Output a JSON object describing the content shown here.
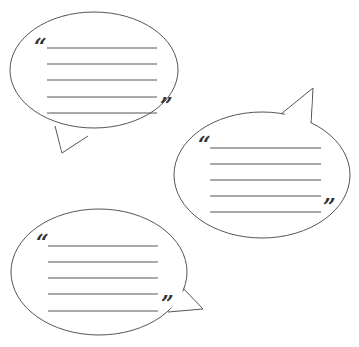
{
  "illustration": {
    "description": "Three blank speech bubbles with writing lines",
    "stroke_color": "#555555",
    "line_color": "#555555",
    "bubbles": [
      {
        "id": "bubble-1",
        "open_quote": "“",
        "close_quote": "”",
        "line_count": 5
      },
      {
        "id": "bubble-2",
        "open_quote": "“",
        "close_quote": "”",
        "line_count": 5
      },
      {
        "id": "bubble-3",
        "open_quote": "“",
        "close_quote": "”",
        "line_count": 5
      }
    ]
  }
}
